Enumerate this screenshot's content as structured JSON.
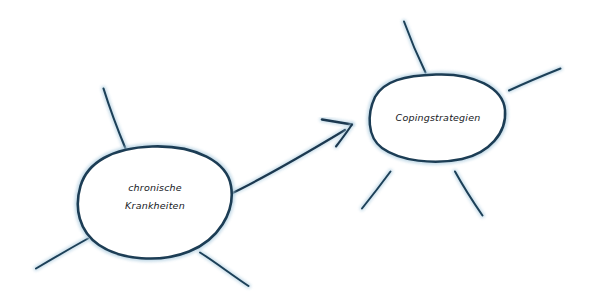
{
  "canvas": {
    "width": 591,
    "height": 307,
    "background": "#ffffff"
  },
  "style": {
    "stroke_dark": "#1b3a52",
    "stroke_mid": "#2e5f80",
    "stroke_light": "#8fbbd4",
    "halo": "#b9d6e6",
    "text_color": "#15181c"
  },
  "diagram": {
    "type": "mind-map",
    "nodes": [
      {
        "id": "chronische-krankheiten",
        "label_line1": "chronische",
        "label_line2": "Krankheiten",
        "cx": 155,
        "cy": 201,
        "rx": 76,
        "ry": 55
      },
      {
        "id": "copingstrategien",
        "label_line1": "Copingstrategien",
        "label_line2": "",
        "cx": 438,
        "cy": 118,
        "rx": 68,
        "ry": 44
      }
    ],
    "connector": {
      "from": "chronische-krankheiten",
      "to": "copingstrategien",
      "kind": "arrow",
      "direction": "left-to-right"
    },
    "spokes_left": 3,
    "spokes_right": 4
  }
}
